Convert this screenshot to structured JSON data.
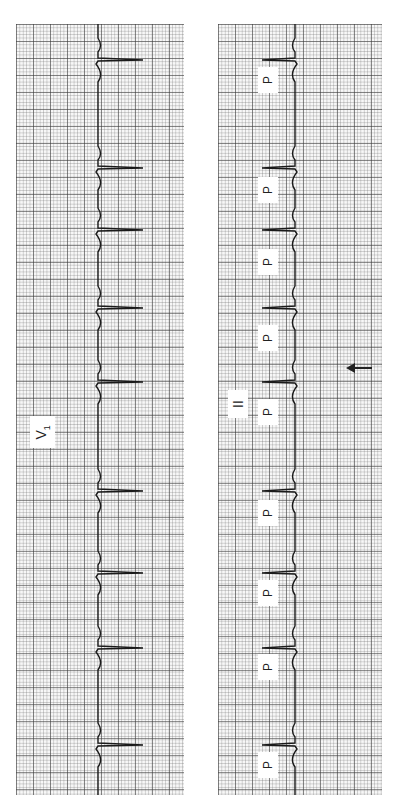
{
  "figure": {
    "strips": [
      {
        "id": "v1",
        "lead_label": "V",
        "lead_subscript": "1",
        "baseline_x": 98,
        "qrs_direction": "right",
        "qrs_peak_x": 143,
        "beats_y": [
          60,
          168,
          230,
          308,
          382,
          491,
          573,
          648,
          745
        ]
      },
      {
        "id": "ii",
        "lead_label": "II",
        "baseline_x": 295,
        "qrs_direction": "left",
        "qrs_peak_x": 262,
        "beats_y": [
          60,
          168,
          230,
          308,
          382,
          491,
          573,
          648,
          745
        ],
        "p_wave_label": "P",
        "p_labels_y": [
          80,
          190,
          262,
          338,
          412,
          513,
          593,
          667,
          765
        ]
      }
    ],
    "annotation": {
      "arrow": "left-arrow",
      "position_y": 368
    },
    "colors": {
      "grid_major": "#5a5a5a",
      "grid_minor": "#9a9a9a",
      "trace": "#1a1a1a",
      "paper": "#f7f7f7"
    }
  }
}
